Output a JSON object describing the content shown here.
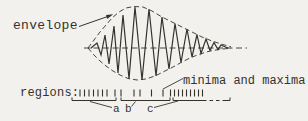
{
  "colors": {
    "background": "#f2f1ee",
    "ink": "#35322c"
  },
  "labels": {
    "envelope": "envelope",
    "regions": "regions:",
    "minima_maxima": "minima and maxima",
    "region_a": "a",
    "region_b": "b",
    "region_c": "c"
  },
  "diagram": {
    "axis": {
      "x1": 84,
      "x2": 247,
      "y": 48,
      "dash": "6 3.5"
    },
    "envelope_top": [
      [
        88,
        48
      ],
      [
        94,
        40
      ],
      [
        100,
        32
      ],
      [
        106,
        25
      ],
      [
        112,
        18
      ],
      [
        119,
        12
      ],
      [
        126,
        8
      ],
      [
        134,
        6.5
      ],
      [
        143,
        7
      ],
      [
        152,
        11
      ],
      [
        162,
        17
      ],
      [
        172,
        22
      ],
      [
        182,
        27
      ],
      [
        192,
        32
      ],
      [
        202,
        37
      ],
      [
        212,
        41
      ],
      [
        221,
        44
      ],
      [
        231,
        46.8
      ]
    ],
    "envelope_bottom": [
      [
        88,
        48
      ],
      [
        94,
        55
      ],
      [
        100,
        61
      ],
      [
        106,
        66
      ],
      [
        113,
        71
      ],
      [
        120,
        75
      ],
      [
        128,
        78.5
      ],
      [
        137,
        80
      ],
      [
        146,
        79
      ],
      [
        155,
        76
      ],
      [
        164,
        71.5
      ],
      [
        173,
        67
      ],
      [
        182,
        62
      ],
      [
        191,
        57.5
      ],
      [
        200,
        54
      ],
      [
        210,
        51
      ],
      [
        220,
        49.3
      ],
      [
        231,
        48.2
      ]
    ],
    "wave": [
      [
        91,
        48
      ],
      [
        97,
        43
      ],
      [
        101,
        55
      ],
      [
        105,
        35
      ],
      [
        109,
        64
      ],
      [
        114,
        26
      ],
      [
        118,
        73
      ],
      [
        123,
        15
      ],
      [
        129,
        79
      ],
      [
        135,
        7
      ],
      [
        142,
        80
      ],
      [
        149,
        9
      ],
      [
        156,
        76
      ],
      [
        162,
        17
      ],
      [
        169,
        69
      ],
      [
        175,
        23.5
      ],
      [
        181,
        62.5
      ],
      [
        187,
        29
      ],
      [
        192,
        57
      ],
      [
        197,
        34.5
      ],
      [
        201,
        53.5
      ],
      [
        206,
        39
      ],
      [
        210,
        50.5
      ],
      [
        214,
        42.5
      ],
      [
        218,
        49.5
      ],
      [
        221,
        45
      ],
      [
        226,
        47.2
      ],
      [
        228,
        48
      ]
    ],
    "ticks": {
      "y1": 89.5,
      "y2": 96.5,
      "region_a": [
        80,
        84.5,
        89,
        93.5,
        98,
        102.5,
        107
      ],
      "region_b": [
        115,
        121,
        134,
        140,
        151.5,
        163
      ],
      "minima_maxima": [
        170.5,
        174.5,
        178.5,
        182.5,
        186.5,
        190.5,
        194.5,
        198.5,
        202.5
      ]
    },
    "brackets": {
      "y": 100.5,
      "hook_y": 97.5,
      "a": {
        "x1": 72,
        "x2": 116
      },
      "b": {
        "x1": 121,
        "x2": 170
      },
      "c": {
        "x1": 173,
        "x2": 230,
        "solid_until": 203,
        "dash_until": 224,
        "dash": "3.5 3"
      }
    },
    "pointers": [
      {
        "name": "pointer-to-a",
        "x1": 90,
        "y1": 101.5,
        "x2": 112,
        "y2": 107.5
      },
      {
        "name": "pointer-to-b",
        "x1": 131.5,
        "y1": 106.5,
        "x2": 135.5,
        "y2": 101.5
      },
      {
        "name": "pointer-to-c",
        "x1": 154,
        "y1": 107.5,
        "x2": 178,
        "y2": 101
      },
      {
        "name": "pointer-minima-maxima",
        "x1": 183,
        "y1": 78.5,
        "x2": 163,
        "y2": 89
      }
    ],
    "arrow": {
      "x1": 79,
      "y1": 26.5,
      "x2": 110.5,
      "y2": 15.5,
      "head": [
        [
          113.2,
          14.2
        ],
        [
          107.2,
          19.0
        ],
        [
          106.0,
          14.9
        ]
      ]
    }
  }
}
